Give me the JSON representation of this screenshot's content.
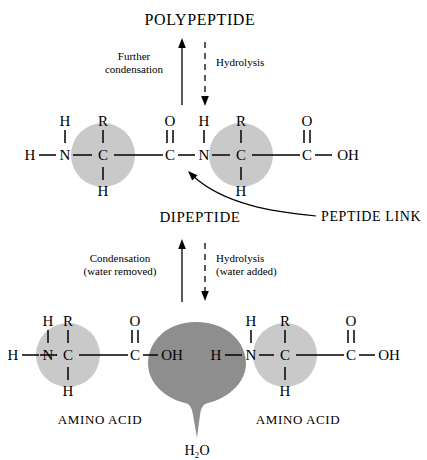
{
  "figure": {
    "title_top": "POLYPEPTIDE",
    "title_middle": "DIPEPTIDE",
    "annotation": "PEPTIDE LINK",
    "water_label": "H₂O",
    "amino_acid_left": "AMINO ACID",
    "amino_acid_right": "AMINO ACID"
  },
  "reactions": {
    "top": {
      "forward_line1": "Further",
      "forward_line2": "condensation",
      "reverse_line1": "Hydrolysis",
      "reverse_line2": ""
    },
    "bottom": {
      "forward_line1": "Condensation",
      "forward_line2": "(water removed)",
      "reverse_line1": "Hydrolysis",
      "reverse_line2": "(water added)"
    }
  },
  "dipeptide": {
    "residue1": {
      "h_terminal": "H",
      "n": "N",
      "n_h": "H",
      "r": "R",
      "c_alpha": "C",
      "c_alpha_h": "H",
      "carbonyl_o": "O",
      "carbonyl_c": "C"
    },
    "link": {
      "n": "N",
      "n_h": "H"
    },
    "residue2": {
      "r": "R",
      "c_alpha": "C",
      "c_alpha_h": "H",
      "carbonyl_o": "O",
      "carbonyl_c": "C",
      "oh": "OH"
    }
  },
  "amino_acid_left_atoms": {
    "h_terminal": "H",
    "n": "N",
    "n_h": "H",
    "r": "R",
    "c_alpha": "C",
    "c_alpha_h": "H",
    "carbonyl_o": "O",
    "carbonyl_c": "C",
    "oh": "OH"
  },
  "amino_acid_right_atoms": {
    "h_terminal": "H",
    "n": "N",
    "n_h": "H",
    "r": "R",
    "c_alpha": "C",
    "c_alpha_h": "H",
    "carbonyl_o": "O",
    "carbonyl_c": "C",
    "oh": "OH"
  },
  "colors": {
    "residue_circle": "#c9c9c9",
    "water_blob": "#8e8e8e",
    "ink": "#000000",
    "background": "#ffffff"
  }
}
